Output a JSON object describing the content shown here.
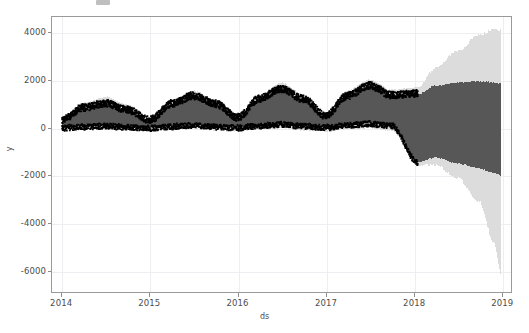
{
  "figure": {
    "background_color": "#ffffff",
    "axes_border_color": "#9a9a9a",
    "grid_color": "#eceef1",
    "title_remnant": ""
  },
  "chart_data": {
    "type": "line",
    "title": "",
    "xlabel": "ds",
    "ylabel": "y",
    "grid": true,
    "legend_position": "none",
    "xlim": [
      "2013-11-20",
      "2019-02-10"
    ],
    "ylim": [
      -6900,
      4650
    ],
    "xticks": [
      "2014",
      "2015",
      "2016",
      "2017",
      "2018",
      "2019"
    ],
    "xtick_values": [
      "2014-01-01",
      "2015-01-01",
      "2016-01-01",
      "2017-01-01",
      "2018-01-01",
      "2019-01-01"
    ],
    "yticks": [
      "4000",
      "2000",
      "0",
      "-2000",
      "-4000",
      "-6000"
    ],
    "ytick_values": [
      4000,
      2000,
      0,
      -2000,
      -4000,
      -6000
    ],
    "history_end": "2018-01-20",
    "colors": {
      "observations": "#000000",
      "uncertainty_inner": "#575757",
      "uncertainty_outer": "#dcdcdc"
    },
    "series": [
      {
        "name": "yhat_upper_outer",
        "kind": "band-upper-outer",
        "x": [
          "2014-01-01",
          "2014-04-01",
          "2014-07-01",
          "2014-10-01",
          "2015-01-01",
          "2015-04-01",
          "2015-07-01",
          "2015-10-01",
          "2016-01-01",
          "2016-04-01",
          "2016-07-01",
          "2016-10-01",
          "2017-01-01",
          "2017-04-01",
          "2017-07-01",
          "2017-10-01",
          "2018-01-20",
          "2018-04-01",
          "2018-07-01",
          "2018-10-01",
          "2018-12-01",
          "2019-01-01"
        ],
        "values": [
          430,
          1050,
          1300,
          960,
          420,
          1130,
          1560,
          1180,
          520,
          1400,
          1880,
          1400,
          600,
          1560,
          2020,
          1600,
          1700,
          2500,
          3200,
          3900,
          4150,
          4100
        ]
      },
      {
        "name": "yhat_upper_inner",
        "kind": "band-upper-inner",
        "x": [
          "2014-01-01",
          "2014-04-01",
          "2014-07-01",
          "2014-10-01",
          "2015-01-01",
          "2015-04-01",
          "2015-07-01",
          "2015-10-01",
          "2016-01-01",
          "2016-04-01",
          "2016-07-01",
          "2016-10-01",
          "2017-01-01",
          "2017-04-01",
          "2017-07-01",
          "2017-10-01",
          "2018-01-20",
          "2018-04-01",
          "2018-07-01",
          "2018-10-01",
          "2018-12-01",
          "2019-01-01"
        ],
        "values": [
          300,
          830,
          1000,
          720,
          300,
          980,
          1330,
          990,
          400,
          1200,
          1620,
          1180,
          480,
          1320,
          1760,
          1350,
          1420,
          1750,
          1900,
          1950,
          1900,
          1850
        ]
      },
      {
        "name": "yhat_lower_inner",
        "kind": "band-lower-inner",
        "x": [
          "2014-01-01",
          "2014-04-01",
          "2014-07-01",
          "2014-10-01",
          "2015-01-01",
          "2015-04-01",
          "2015-07-01",
          "2015-10-01",
          "2016-01-01",
          "2016-04-01",
          "2016-07-01",
          "2016-10-01",
          "2017-01-01",
          "2017-04-01",
          "2017-07-01",
          "2017-10-01",
          "2018-01-20",
          "2018-04-01",
          "2018-07-01",
          "2018-10-01",
          "2018-12-01",
          "2019-01-01"
        ],
        "values": [
          20,
          60,
          90,
          40,
          10,
          70,
          120,
          60,
          20,
          100,
          160,
          90,
          30,
          120,
          190,
          110,
          -1450,
          -1250,
          -1500,
          -1700,
          -1900,
          -2000
        ]
      },
      {
        "name": "yhat_lower_outer",
        "kind": "band-lower-outer",
        "x": [
          "2014-01-01",
          "2014-04-01",
          "2014-07-01",
          "2014-10-01",
          "2015-01-01",
          "2015-04-01",
          "2015-07-01",
          "2015-10-01",
          "2016-01-01",
          "2016-04-01",
          "2016-07-01",
          "2016-10-01",
          "2017-01-01",
          "2017-04-01",
          "2017-07-01",
          "2017-10-01",
          "2018-01-20",
          "2018-04-01",
          "2018-07-01",
          "2018-10-01",
          "2018-12-01",
          "2019-01-01"
        ],
        "values": [
          -120,
          -90,
          -60,
          -110,
          -140,
          -80,
          -40,
          -120,
          -150,
          -60,
          -20,
          -110,
          -160,
          -60,
          -20,
          -120,
          -1600,
          -1550,
          -2100,
          -3100,
          -4800,
          -6200
        ]
      },
      {
        "name": "observations",
        "kind": "scatter",
        "note": "dense daily black points, upper cluster tracks seasonal peak, lower cluster near zero baseline",
        "x": [
          "2014-01-01",
          "2014-07-01",
          "2015-01-01",
          "2015-07-01",
          "2016-01-01",
          "2016-07-01",
          "2017-01-01",
          "2017-07-01",
          "2018-01-10"
        ],
        "upper_values": [
          350,
          1150,
          420,
          1500,
          560,
          1820,
          640,
          2050,
          1450
        ],
        "lower_values": [
          0,
          250,
          20,
          300,
          40,
          400,
          60,
          480,
          250
        ]
      }
    ]
  },
  "axis_label_font_size_px": 8.5
}
